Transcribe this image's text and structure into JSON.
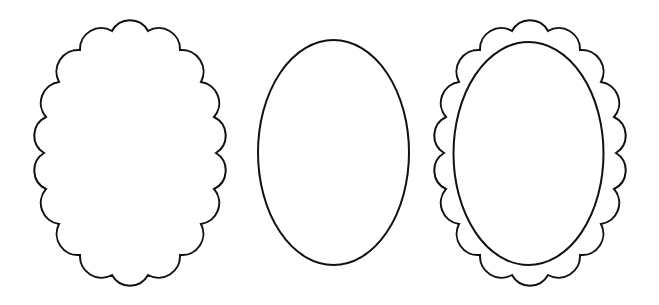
{
  "canvas": {
    "width": 659,
    "height": 305,
    "background": "#ffffff"
  },
  "style": {
    "stroke_color": "#111111",
    "stroke_width": 2,
    "fill": "#ffffff"
  },
  "scallop_template": {
    "notch_offsets": [
      [
        -18,
        -122
      ],
      [
        18,
        -122
      ],
      [
        50,
        -103
      ],
      [
        71,
        -71
      ],
      [
        84,
        -36
      ],
      [
        86,
        0
      ],
      [
        84,
        36
      ],
      [
        71,
        71
      ],
      [
        50,
        102
      ],
      [
        18,
        122
      ],
      [
        -18,
        122
      ],
      [
        -50,
        102
      ],
      [
        -71,
        71
      ],
      [
        -84,
        36
      ],
      [
        -86,
        0
      ],
      [
        -84,
        -36
      ],
      [
        -71,
        -71
      ],
      [
        -50,
        -103
      ]
    ],
    "scallop_count": 18,
    "arc_radius_factor": 1.14
  },
  "shapes": [
    {
      "id": "scalloped-oval-frame",
      "type": "scalloped-oval",
      "center": [
        130,
        153
      ]
    },
    {
      "id": "plain-oval-frame",
      "type": "oval",
      "center": [
        333.5,
        152.5
      ],
      "rx": 75.5,
      "ry": 112.5
    },
    {
      "id": "scalloped-oval-with-inner-oval-frame",
      "type": "scalloped-oval-with-inner-oval",
      "center": [
        530,
        153
      ],
      "inner": {
        "center": [
          528.5,
          153.5
        ],
        "rx": 75,
        "ry": 111.5
      }
    }
  ]
}
